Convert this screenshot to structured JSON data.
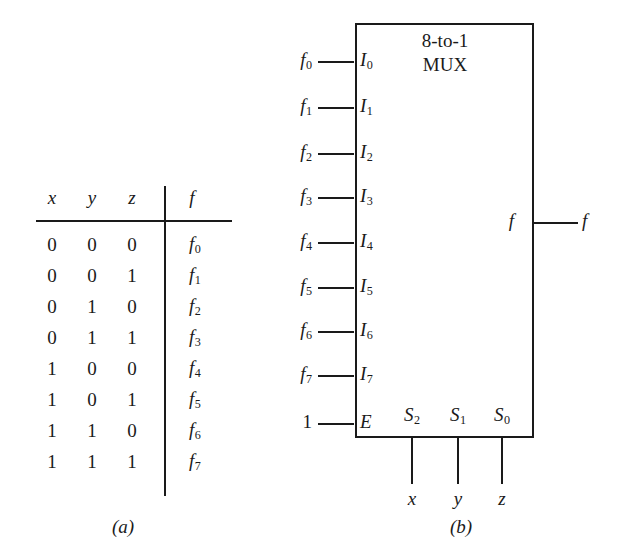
{
  "figure": {
    "caption_a": "(a)",
    "caption_b": "(b)"
  },
  "truth_table": {
    "headers": [
      "x",
      "y",
      "z",
      "f"
    ],
    "rows": [
      {
        "x": "0",
        "y": "0",
        "z": "0",
        "f": "f",
        "f_sub": "0"
      },
      {
        "x": "0",
        "y": "0",
        "z": "1",
        "f": "f",
        "f_sub": "1"
      },
      {
        "x": "0",
        "y": "1",
        "z": "0",
        "f": "f",
        "f_sub": "2"
      },
      {
        "x": "0",
        "y": "1",
        "z": "1",
        "f": "f",
        "f_sub": "3"
      },
      {
        "x": "1",
        "y": "0",
        "z": "0",
        "f": "f",
        "f_sub": "4"
      },
      {
        "x": "1",
        "y": "0",
        "z": "1",
        "f": "f",
        "f_sub": "5"
      },
      {
        "x": "1",
        "y": "1",
        "z": "0",
        "f": "f",
        "f_sub": "6"
      },
      {
        "x": "1",
        "y": "1",
        "z": "1",
        "f": "f",
        "f_sub": "7"
      }
    ]
  },
  "mux": {
    "title_line1": "8-to-1",
    "title_line2": "MUX",
    "inputs": [
      {
        "signal": "f",
        "signal_sub": "0",
        "port": "I",
        "port_sub": "0"
      },
      {
        "signal": "f",
        "signal_sub": "1",
        "port": "I",
        "port_sub": "1"
      },
      {
        "signal": "f",
        "signal_sub": "2",
        "port": "I",
        "port_sub": "2"
      },
      {
        "signal": "f",
        "signal_sub": "3",
        "port": "I",
        "port_sub": "3"
      },
      {
        "signal": "f",
        "signal_sub": "4",
        "port": "I",
        "port_sub": "4"
      },
      {
        "signal": "f",
        "signal_sub": "5",
        "port": "I",
        "port_sub": "5"
      },
      {
        "signal": "f",
        "signal_sub": "6",
        "port": "I",
        "port_sub": "6"
      },
      {
        "signal": "f",
        "signal_sub": "7",
        "port": "I",
        "port_sub": "7"
      }
    ],
    "enable": {
      "signal": "1",
      "port": "E"
    },
    "selects": [
      {
        "port": "S",
        "port_sub": "2",
        "label": "x"
      },
      {
        "port": "S",
        "port_sub": "1",
        "label": "y"
      },
      {
        "port": "S",
        "port_sub": "0",
        "label": "z"
      }
    ],
    "output": {
      "port": "f",
      "label": "f"
    }
  },
  "colors": {
    "ink": "#1a1a1a",
    "background": "#ffffff"
  }
}
